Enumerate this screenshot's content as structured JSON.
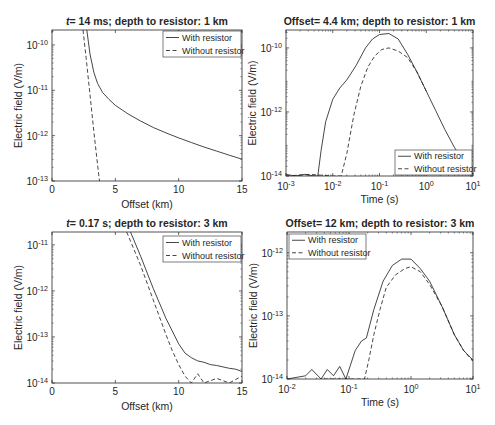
{
  "figure": {
    "width": 495,
    "height": 425
  },
  "chart_data": [
    {
      "id": "panel-a",
      "type": "line",
      "title_prefix": "t",
      "title": "= 14 ms; depth to resistor: 1 km",
      "xlabel": "Offset (km)",
      "ylabel": "Electric field (V/m)",
      "xscale": "linear",
      "yscale": "log",
      "xlim": [
        0,
        15
      ],
      "ylim_exp": [
        -13,
        -9.67
      ],
      "xticks": [
        0,
        5,
        10,
        15
      ],
      "xtick_labels": [
        "0",
        "5",
        "10",
        "15"
      ],
      "yticks_exp": [
        -13,
        -12,
        -11,
        -10
      ],
      "box": [
        52,
        30,
        242,
        181
      ],
      "legend": {
        "position": "top-right",
        "box": [
          163,
          31,
          241,
          57
        ]
      },
      "series": [
        {
          "name": "With resistor",
          "style": "solid",
          "x": [
            2.75,
            3.0,
            3.3,
            3.6,
            4.0,
            4.5,
            5.0,
            6.0,
            7.0,
            8.0,
            9.0,
            10.0,
            11.0,
            12.0,
            13.0,
            14.0,
            15.0
          ],
          "y_exp": [
            -9.67,
            -10.2,
            -10.6,
            -10.85,
            -11.05,
            -11.2,
            -11.33,
            -11.52,
            -11.68,
            -11.82,
            -11.94,
            -12.05,
            -12.15,
            -12.25,
            -12.34,
            -12.43,
            -12.52
          ]
        },
        {
          "name": "Without resistor",
          "style": "dashed",
          "x": [
            2.45,
            2.7,
            3.0,
            3.3,
            3.6,
            3.75
          ],
          "y_exp": [
            -9.67,
            -10.3,
            -11.1,
            -11.9,
            -12.65,
            -13.0
          ]
        }
      ]
    },
    {
      "id": "panel-b",
      "type": "line",
      "title": "Offset= 4.4 km; depth to resistor: 1 km",
      "xlabel": "Time (s)",
      "ylabel": "Electric field (V/m)",
      "xscale": "log",
      "yscale": "log",
      "xlim_exp": [
        -3,
        1
      ],
      "ylim_exp": [
        -14,
        -9.44
      ],
      "xticks_exp": [
        -3,
        -2,
        -1,
        0,
        1
      ],
      "yticks_exp": [
        -14,
        -12,
        -10
      ],
      "box": [
        286,
        30,
        473,
        176
      ],
      "legend": {
        "position": "bottom-right",
        "box": [
          395,
          150,
          472,
          175
        ]
      },
      "series": [
        {
          "name": "With resistor",
          "style": "solid",
          "x_exp": [
            -3,
            -2.8,
            -2.6,
            -2.4,
            -2.32,
            -2.25,
            -2.15,
            -2.0,
            -1.85,
            -1.7,
            -1.5,
            -1.3,
            -1.15,
            -1.0,
            -0.8,
            -0.6,
            -0.4,
            -0.2,
            0,
            0.2,
            0.4,
            0.6,
            0.8,
            0.92,
            1.0
          ],
          "y_exp": [
            -13.95,
            -14,
            -13.95,
            -14,
            -14,
            -13.2,
            -12.3,
            -11.6,
            -11.25,
            -11.0,
            -10.55,
            -10.0,
            -9.72,
            -9.58,
            -9.55,
            -9.72,
            -10.2,
            -10.75,
            -11.35,
            -11.95,
            -12.55,
            -13.1,
            -13.55,
            -13.75,
            -13.95
          ]
        },
        {
          "name": "Without resistor",
          "style": "dashed",
          "x_exp": [
            -3,
            -2.5,
            -2.0,
            -1.82,
            -1.7,
            -1.55,
            -1.4,
            -1.25,
            -1.1,
            -0.95,
            -0.8,
            -0.6,
            -0.4,
            -0.2,
            0
          ],
          "y_exp": [
            -14,
            -13.95,
            -14,
            -14,
            -13.3,
            -12.1,
            -11.2,
            -10.6,
            -10.25,
            -10.05,
            -10.0,
            -10.1,
            -10.3,
            -10.75,
            -11.35
          ]
        }
      ]
    },
    {
      "id": "panel-c",
      "type": "line",
      "title_prefix": "t",
      "title": "= 0.17 s; depth to resistor: 3 km",
      "xlabel": "Offset (km)",
      "ylabel": "Electric field (V/m)",
      "xscale": "linear",
      "yscale": "log",
      "xlim": [
        0,
        15
      ],
      "ylim_exp": [
        -14,
        -10.72
      ],
      "xticks": [
        0,
        5,
        10,
        15
      ],
      "xtick_labels": [
        "0",
        "5",
        "10",
        "15"
      ],
      "yticks_exp": [
        -14,
        -13,
        -12,
        -11
      ],
      "box": [
        52,
        232,
        242,
        383
      ],
      "legend": {
        "position": "top-right",
        "box": [
          163,
          236,
          241,
          262
        ]
      },
      "series": [
        {
          "name": "With resistor",
          "style": "solid",
          "x": [
            6.2,
            7.0,
            8.0,
            9.0,
            10.0,
            10.5,
            11.0,
            11.5,
            12.0,
            12.5,
            13.0,
            13.5,
            14.0,
            14.5,
            15.0
          ],
          "y_exp": [
            -10.72,
            -11.25,
            -11.95,
            -12.6,
            -13.15,
            -13.35,
            -13.45,
            -13.52,
            -13.55,
            -13.6,
            -13.62,
            -13.65,
            -13.68,
            -13.7,
            -13.75
          ]
        },
        {
          "name": "Without resistor",
          "style": "dashed",
          "x": [
            5.9,
            7.0,
            8.0,
            9.0,
            9.5,
            10.0,
            10.5,
            11.0,
            11.5,
            12.0,
            13.0,
            14.0,
            15.0
          ],
          "y_exp": [
            -10.72,
            -11.45,
            -12.2,
            -12.95,
            -13.3,
            -13.6,
            -13.85,
            -14.0,
            -13.8,
            -14.0,
            -13.9,
            -14.0,
            -13.85
          ]
        }
      ]
    },
    {
      "id": "panel-d",
      "type": "line",
      "title": "Offset= 12 km; depth to resistor: 3 km",
      "xlabel": "Time (s)",
      "ylabel": "Electric field (V/m)",
      "xscale": "log",
      "yscale": "log",
      "xlim_exp": [
        -2,
        1
      ],
      "ylim_exp": [
        -14,
        -11.67
      ],
      "xticks_exp": [
        -2,
        -1,
        0,
        1
      ],
      "yticks_exp": [
        -14,
        -13,
        -12
      ],
      "box": [
        287,
        232,
        473,
        379
      ],
      "legend": {
        "position": "top-left",
        "box": [
          289,
          234,
          366,
          259
        ]
      },
      "series": [
        {
          "name": "With resistor",
          "style": "solid",
          "x_exp": [
            -2,
            -1.7,
            -1.6,
            -1.45,
            -1.35,
            -1.25,
            -1.15,
            -1.05,
            -0.9,
            -0.8,
            -0.72,
            -0.6,
            -0.45,
            -0.3,
            -0.15,
            0,
            0.15,
            0.3,
            0.5,
            0.7,
            0.85,
            1.0
          ],
          "y_exp": [
            -14,
            -13.95,
            -13.85,
            -14,
            -13.85,
            -13.95,
            -13.8,
            -14,
            -13.55,
            -13.4,
            -13.35,
            -12.9,
            -12.45,
            -12.2,
            -12.1,
            -12.1,
            -12.25,
            -12.45,
            -12.85,
            -13.3,
            -13.55,
            -13.7
          ]
        },
        {
          "name": "Without resistor",
          "style": "dashed",
          "x_exp": [
            -1.4,
            -0.75,
            -0.68,
            -0.6,
            -0.5,
            -0.4,
            -0.25,
            -0.1,
            0,
            0.15,
            0.3,
            0.5,
            0.7,
            0.85,
            1.0
          ],
          "y_exp": [
            -14,
            -14,
            -13.7,
            -13.3,
            -12.9,
            -12.55,
            -12.35,
            -12.25,
            -12.22,
            -12.3,
            -12.5,
            -12.85,
            -13.3,
            -13.55,
            -13.72
          ]
        }
      ]
    }
  ]
}
